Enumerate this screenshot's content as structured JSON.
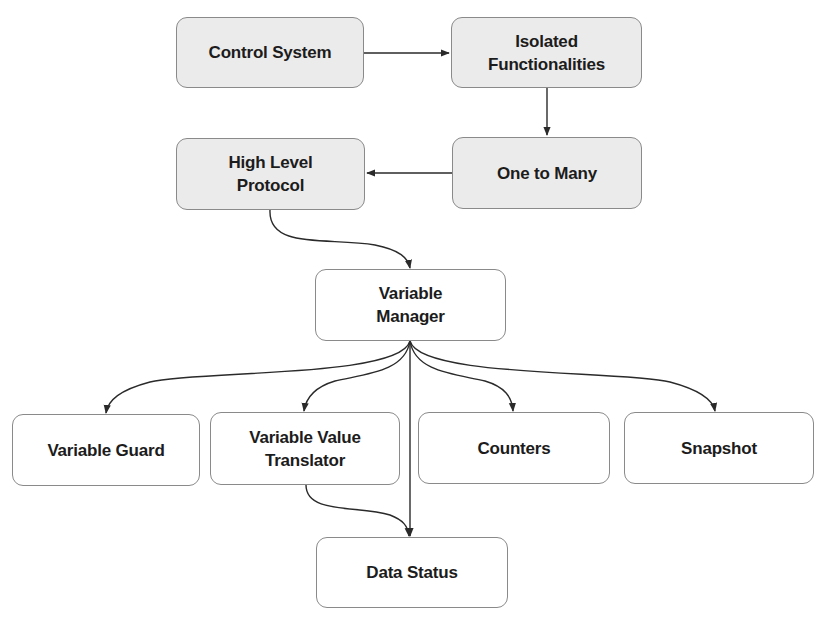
{
  "diagram": {
    "type": "flowchart",
    "colors": {
      "background": "#ffffff",
      "shaded_fill": "#ebebeb",
      "plain_fill": "#ffffff",
      "border": "#8a8a8a",
      "edge": "#2a2a2a",
      "text": "#1c1c1c"
    },
    "nodes": {
      "control_system": {
        "label": "Control System",
        "style": "shaded"
      },
      "isolated_functionalities": {
        "label": "Isolated\nFunctionalities",
        "style": "shaded"
      },
      "one_to_many": {
        "label": "One to Many",
        "style": "shaded"
      },
      "high_level_protocol": {
        "label": "High Level\nProtocol",
        "style": "shaded"
      },
      "variable_manager": {
        "label": "Variable\nManager",
        "style": "plain"
      },
      "variable_guard": {
        "label": "Variable Guard",
        "style": "plain"
      },
      "variable_value_translator": {
        "label": "Variable Value\nTranslator",
        "style": "plain"
      },
      "counters": {
        "label": "Counters",
        "style": "plain"
      },
      "snapshot": {
        "label": "Snapshot",
        "style": "plain"
      },
      "data_status": {
        "label": "Data Status",
        "style": "plain"
      }
    },
    "edges": [
      {
        "from": "control_system",
        "to": "isolated_functionalities",
        "shape": "straight"
      },
      {
        "from": "isolated_functionalities",
        "to": "one_to_many",
        "shape": "straight"
      },
      {
        "from": "one_to_many",
        "to": "high_level_protocol",
        "shape": "straight"
      },
      {
        "from": "high_level_protocol",
        "to": "variable_manager",
        "shape": "curved"
      },
      {
        "from": "variable_manager",
        "to": "variable_guard",
        "shape": "curved"
      },
      {
        "from": "variable_manager",
        "to": "variable_value_translator",
        "shape": "curved"
      },
      {
        "from": "variable_manager",
        "to": "counters",
        "shape": "curved"
      },
      {
        "from": "variable_manager",
        "to": "snapshot",
        "shape": "curved"
      },
      {
        "from": "variable_manager",
        "to": "data_status",
        "shape": "straight"
      },
      {
        "from": "variable_value_translator",
        "to": "data_status",
        "shape": "curved"
      }
    ]
  }
}
